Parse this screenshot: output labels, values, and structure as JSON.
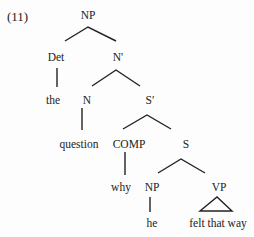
{
  "example_number": "(11)",
  "tree": {
    "root": "NP",
    "nodes": {
      "np_root": "NP",
      "det": "Det",
      "n_bar": "N'",
      "the": "the",
      "n": "N",
      "s_bar": "S′",
      "question": "question",
      "comp": "COMP",
      "s": "S",
      "why": "why",
      "np_sub": "NP",
      "vp": "VP",
      "he": "he",
      "felt_that_way": "felt that way"
    },
    "structure": "[NP [Det the] [N' [N question] [S' [COMP why] [S [NP he] [VP felt that way]]]]]"
  }
}
